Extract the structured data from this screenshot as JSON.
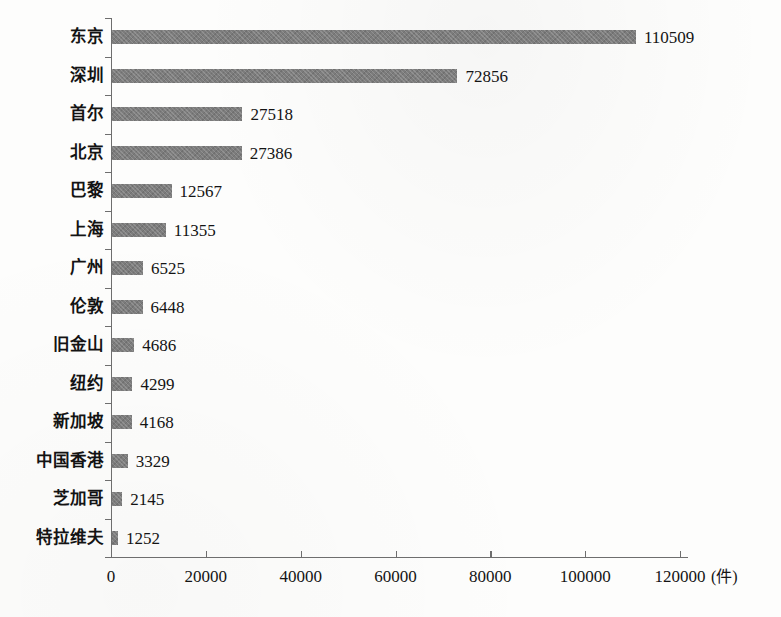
{
  "chart_data": {
    "type": "bar",
    "orientation": "horizontal",
    "title": "",
    "subtitle": "",
    "xlabel": "(件)",
    "ylabel": "",
    "categories": [
      "东京",
      "深圳",
      "首尔",
      "北京",
      "巴黎",
      "上海",
      "广州",
      "伦敦",
      "旧金山",
      "纽约",
      "新加坡",
      "中国香港",
      "芝加哥",
      "特拉维夫"
    ],
    "values": [
      110509,
      72856,
      27518,
      27386,
      12567,
      11355,
      6525,
      6448,
      4686,
      4299,
      4168,
      3329,
      2145,
      1252
    ],
    "value_labels": [
      "110509",
      "72856",
      "27518",
      "27386",
      "12567",
      "11355",
      "6525",
      "6448",
      "4686",
      "4299",
      "4168",
      "3329",
      "2145",
      "1252"
    ],
    "xlim": [
      0,
      120000
    ],
    "xticks": [
      0,
      20000,
      40000,
      60000,
      80000,
      100000,
      120000
    ],
    "xtick_labels": [
      "0",
      "20000",
      "40000",
      "60000",
      "80000",
      "100000",
      "120000"
    ],
    "grid": false,
    "legend": null,
    "bar_color": "#7c7c7c",
    "axis_color": "#6e6e6e",
    "text_color": "#141414",
    "background_color": "#fdfdfc"
  },
  "unit": {
    "label": "(件)"
  },
  "axis": {
    "x_unit_suffix": "(件)"
  }
}
